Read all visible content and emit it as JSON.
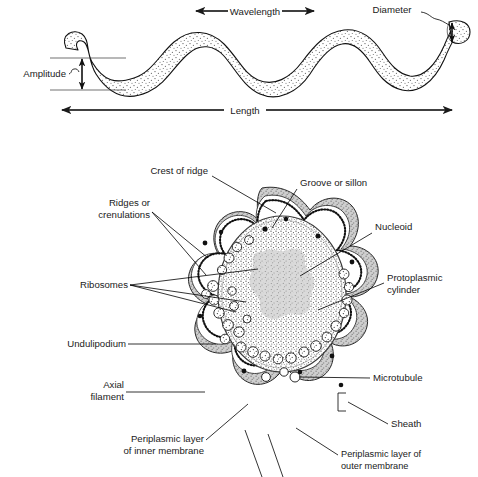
{
  "figure": {
    "background": "#ffffff",
    "ink": "#000000",
    "stipple": "#7a7a7a"
  },
  "top_diagram": {
    "name": "spirochete-whole-cell",
    "labels": {
      "wavelength": "Wavelength",
      "diameter": "Diameter",
      "amplitude": "Amplitude",
      "length": "Length"
    }
  },
  "cross_section": {
    "name": "spirochete-cross-section",
    "labels": {
      "crest_of_ridge": "Crest of ridge",
      "ridges_or_crenulations_l1": "Ridges or",
      "ridges_or_crenulations_l2": "crenulations",
      "ribosomes": "Ribosomes",
      "undulipodium": "Undulipodium",
      "axial_filament_l1": "Axial",
      "axial_filament_l2": "filament",
      "periplasmic_inner_l1": "Periplasmic layer",
      "periplasmic_inner_l2": "of inner membrane",
      "groove_or_sillon": "Groove or sillon",
      "nucleoid": "Nucleoid",
      "protoplasmic_cylinder_l1": "Protoplasmic",
      "protoplasmic_cylinder_l2": "cylinder",
      "microtubule": "Microtubule",
      "sheath": "Sheath",
      "periplasmic_outer_l1": "Periplasmic layer of",
      "periplasmic_outer_l2": "outer membrane"
    }
  }
}
